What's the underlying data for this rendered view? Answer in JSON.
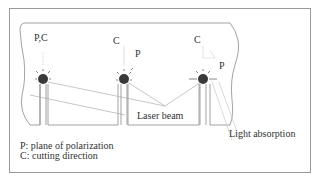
{
  "diagram": {
    "title": "",
    "holes": [
      {
        "id": "hole-1",
        "label": "P, C",
        "description": "Polarization parallel to cutting direction"
      },
      {
        "id": "hole-2",
        "label_c": "C",
        "label_p": "P",
        "description": "Polarization at 45 degrees to cutting direction"
      },
      {
        "id": "hole-3",
        "label_c": "C",
        "label_p": "P",
        "description": "Polarization perpendicular to cutting direction"
      }
    ],
    "labels": {
      "hole1": "P,C",
      "hole2_c": "C",
      "hole2_p": "P",
      "hole3_c": "C",
      "hole3_p": "P",
      "laser_beam": "Laser beam",
      "light_absorption": "Light absorption"
    },
    "legend": {
      "p": "P: plane of polarization",
      "c": "C: cutting direction"
    },
    "colors": {
      "frame": "#9a9a9a",
      "outline": "#8a8a8a",
      "hole": "#3a3a3a",
      "beam": "#b8b8b8",
      "text": "#333333"
    }
  }
}
